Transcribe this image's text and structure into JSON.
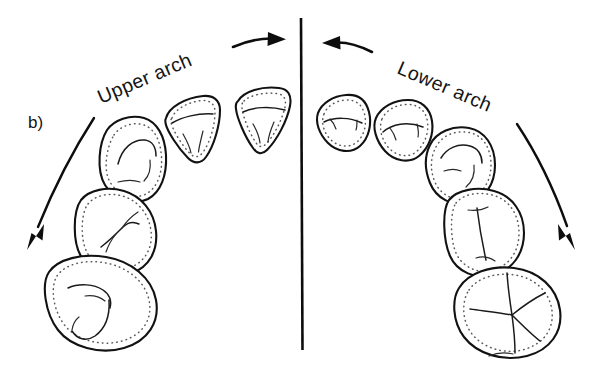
{
  "figure": {
    "panel_label": "b)",
    "caption_labels": {
      "left_arch": "Upper arch",
      "right_arch": "Lower arch"
    },
    "colors": {
      "background": "#ffffff",
      "outline": "#121212",
      "dotted_fissure": "#5a5a5a",
      "groove": "#1a1a1a",
      "arrow": "#0d0d0d",
      "text": "#141414"
    },
    "midline": {
      "name": "dental-midline",
      "x": 301,
      "y_top": 18,
      "y_bottom": 350
    },
    "direction_arrows": [
      {
        "name": "left-top-arrow",
        "label": "",
        "points_to": "right",
        "description": "straight arrow above upper arch pointing toward midline"
      },
      {
        "name": "right-top-arrow",
        "label": "",
        "points_to": "left",
        "description": "straight arrow above lower arch pointing toward midline"
      },
      {
        "name": "left-arc-arrow",
        "label": "",
        "points_to": "down-left",
        "description": "curved arc arrow sweeping down the left side of the upper arch"
      },
      {
        "name": "right-arc-arrow",
        "label": "",
        "points_to": "down-right",
        "description": "curved arc arrow sweeping down the right side of the lower arch"
      }
    ],
    "left_arch_teeth": [
      {
        "name": "upper-central-incisor",
        "type": "incisor",
        "order": 1
      },
      {
        "name": "upper-lateral-incisor",
        "type": "incisor",
        "order": 2
      },
      {
        "name": "upper-canine",
        "type": "canine",
        "order": 3
      },
      {
        "name": "upper-premolar",
        "type": "premolar",
        "order": 4
      },
      {
        "name": "upper-molar",
        "type": "molar",
        "order": 5
      }
    ],
    "right_arch_teeth": [
      {
        "name": "lower-central-incisor",
        "type": "incisor",
        "order": 1
      },
      {
        "name": "lower-lateral-incisor",
        "type": "incisor",
        "order": 2
      },
      {
        "name": "lower-canine",
        "type": "canine",
        "order": 3
      },
      {
        "name": "lower-premolar",
        "type": "premolar",
        "order": 4
      },
      {
        "name": "lower-molar",
        "type": "molar",
        "order": 5
      }
    ]
  }
}
